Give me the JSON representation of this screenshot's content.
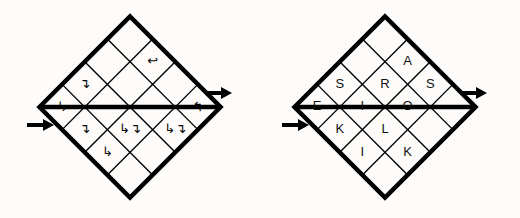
{
  "page": {
    "background_color": "#fdfcfa",
    "ink_color": "#000000",
    "width": 520,
    "height": 218
  },
  "figures": [
    {
      "id": "left-figure",
      "name": "arrow-grid",
      "kind": "diamond-grid",
      "rows": 4,
      "cols": 4,
      "center_x": 130,
      "center_y": 107,
      "cell_size": 32,
      "rotation_deg": -45,
      "entry_arrow": {
        "name": "entry-arrow-left",
        "glyph": "→",
        "x": 40,
        "y": 125,
        "direction": "right"
      },
      "exit_arrow": {
        "name": "exit-arrow-right",
        "glyph": "→",
        "x": 218,
        "y": 93,
        "direction": "right"
      },
      "diagonals": [
        {
          "name": "diagonal-upper-left",
          "from_row": 0,
          "from_col": 0,
          "to_row": 2,
          "to_col": 2
        },
        {
          "name": "diagonal-lower-right",
          "from_row": 2,
          "from_col": 2,
          "to_row": 4,
          "to_col": 4
        }
      ],
      "cells": [
        {
          "row": 0,
          "col": 0,
          "glyph": "↳",
          "name": "cell-0-0"
        },
        {
          "row": 0,
          "col": 1,
          "glyph": "↴",
          "name": "cell-0-1"
        },
        {
          "row": 0,
          "col": 2,
          "glyph": "",
          "name": "cell-0-2"
        },
        {
          "row": 0,
          "col": 3,
          "glyph": "",
          "name": "cell-0-3"
        },
        {
          "row": 1,
          "col": 0,
          "glyph": "↴",
          "name": "cell-1-0"
        },
        {
          "row": 1,
          "col": 1,
          "glyph": "",
          "name": "cell-1-1"
        },
        {
          "row": 1,
          "col": 2,
          "glyph": "",
          "name": "cell-1-2"
        },
        {
          "row": 1,
          "col": 3,
          "glyph": "↩",
          "name": "cell-1-3"
        },
        {
          "row": 2,
          "col": 0,
          "glyph": "↳",
          "name": "cell-2-0"
        },
        {
          "row": 2,
          "col": 1,
          "glyph": "↳↴",
          "name": "cell-2-1"
        },
        {
          "row": 2,
          "col": 2,
          "glyph": "",
          "name": "cell-2-2"
        },
        {
          "row": 2,
          "col": 3,
          "glyph": "",
          "name": "cell-2-3"
        },
        {
          "row": 3,
          "col": 0,
          "glyph": "",
          "name": "cell-3-0"
        },
        {
          "row": 3,
          "col": 1,
          "glyph": "",
          "name": "cell-3-1"
        },
        {
          "row": 3,
          "col": 2,
          "glyph": "↳↴",
          "name": "cell-3-2"
        },
        {
          "row": 3,
          "col": 3,
          "glyph": "↰",
          "name": "cell-3-3"
        }
      ],
      "extra_glyphs": [
        {
          "name": "arrow-up-left-edge",
          "glyph": "↰",
          "row": 3,
          "col": 0,
          "offset": "edge"
        },
        {
          "name": "arrow-up-bottom",
          "glyph": "↰",
          "row": 4,
          "col": 2,
          "offset": "edge"
        },
        {
          "name": "arrow-right-bottom",
          "glyph": "↳",
          "row": 4,
          "col": 1,
          "offset": "edge"
        },
        {
          "name": "arrow-left-inner",
          "glyph": "↩",
          "row": 3,
          "col": 3,
          "offset": "edge"
        },
        {
          "name": "arrow-up-right",
          "glyph": "↰",
          "row": 3,
          "col": 3,
          "offset": "edge"
        }
      ]
    },
    {
      "id": "right-figure",
      "name": "letter-grid",
      "kind": "diamond-grid",
      "rows": 4,
      "cols": 4,
      "center_x": 385,
      "center_y": 107,
      "cell_size": 32,
      "rotation_deg": -45,
      "entry_arrow": {
        "name": "entry-arrow-left",
        "glyph": "→",
        "x": 295,
        "y": 125,
        "direction": "right"
      },
      "exit_arrow": {
        "name": "exit-arrow-right",
        "glyph": "→",
        "x": 473,
        "y": 93,
        "direction": "right"
      },
      "diagonals": [
        {
          "name": "diagonal-upper-left",
          "from_row": 0,
          "from_col": 0,
          "to_row": 2,
          "to_col": 2
        },
        {
          "name": "diagonal-lower-right",
          "from_row": 2,
          "from_col": 2,
          "to_row": 4,
          "to_col": 4
        }
      ],
      "cells": [
        {
          "row": 0,
          "col": 0,
          "letter": "E",
          "name": "cell-0-0"
        },
        {
          "row": 0,
          "col": 1,
          "letter": "S",
          "name": "cell-0-1"
        },
        {
          "row": 0,
          "col": 2,
          "letter": "",
          "name": "cell-0-2"
        },
        {
          "row": 0,
          "col": 3,
          "letter": "",
          "name": "cell-0-3"
        },
        {
          "row": 1,
          "col": 0,
          "letter": "K",
          "name": "cell-1-0"
        },
        {
          "row": 1,
          "col": 1,
          "letter": "I",
          "name": "cell-1-1"
        },
        {
          "row": 1,
          "col": 2,
          "letter": "R",
          "name": "cell-1-2"
        },
        {
          "row": 1,
          "col": 3,
          "letter": "A",
          "name": "cell-1-3"
        },
        {
          "row": 2,
          "col": 0,
          "letter": "I",
          "name": "cell-2-0"
        },
        {
          "row": 2,
          "col": 1,
          "letter": "L",
          "name": "cell-2-1"
        },
        {
          "row": 2,
          "col": 2,
          "letter": "O",
          "name": "cell-2-2"
        },
        {
          "row": 2,
          "col": 3,
          "letter": "S",
          "name": "cell-2-3"
        },
        {
          "row": 3,
          "col": 0,
          "letter": "",
          "name": "cell-3-0"
        },
        {
          "row": 3,
          "col": 1,
          "letter": "K",
          "name": "cell-3-1"
        },
        {
          "row": 3,
          "col": 2,
          "letter": "",
          "name": "cell-3-2"
        },
        {
          "row": 3,
          "col": 3,
          "letter": "",
          "name": "cell-3-3"
        }
      ],
      "word_readings": [
        {
          "name": "row-top",
          "text": "ES"
        },
        {
          "name": "row-second",
          "text": "KIRA"
        },
        {
          "name": "row-third",
          "text": "ILOS"
        },
        {
          "name": "row-bottom",
          "text": "K"
        }
      ]
    }
  ]
}
